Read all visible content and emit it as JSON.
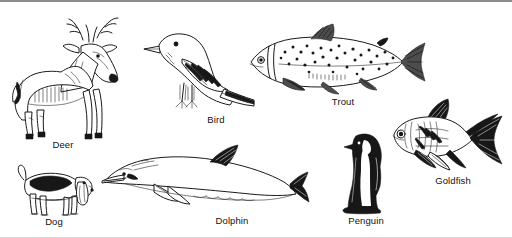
{
  "page": {
    "background_color": "#ffffff",
    "ink_color": "#1a1a1a",
    "border_color": "#8d8d8d",
    "width": 512,
    "height": 238,
    "style": "black-and-white line art drawings with captions"
  },
  "figures": [
    {
      "id": "deer",
      "label": "Deer",
      "icon": "deer-illustration",
      "group": "mammal",
      "facing": "right",
      "caption_x": 63,
      "caption_y": 142,
      "box": {
        "x": 5,
        "y": 10,
        "w": 125,
        "h": 130
      }
    },
    {
      "id": "bird",
      "label": "Bird",
      "icon": "bird-illustration",
      "group": "bird",
      "facing": "left",
      "caption_x": 215,
      "caption_y": 117,
      "box": {
        "x": 130,
        "y": 25,
        "w": 120,
        "h": 90
      }
    },
    {
      "id": "trout",
      "label": "Trout",
      "icon": "trout-illustration",
      "group": "fish",
      "facing": "left",
      "caption_x": 342,
      "caption_y": 99,
      "box": {
        "x": 245,
        "y": 20,
        "w": 180,
        "h": 75
      }
    },
    {
      "id": "goldfish",
      "label": "Goldfish",
      "icon": "goldfish-illustration",
      "group": "fish",
      "facing": "left",
      "caption_x": 452,
      "caption_y": 178,
      "box": {
        "x": 386,
        "y": 96,
        "w": 122,
        "h": 78
      }
    },
    {
      "id": "dog",
      "label": "Dog",
      "icon": "dog-illustration",
      "group": "mammal",
      "facing": "right",
      "caption_x": 54,
      "caption_y": 219,
      "box": {
        "x": 14,
        "y": 158,
        "w": 80,
        "h": 58
      }
    },
    {
      "id": "dolphin",
      "label": "Dolphin",
      "icon": "dolphin-illustration",
      "group": "mammal",
      "facing": "left",
      "caption_x": 232,
      "caption_y": 218,
      "box": {
        "x": 98,
        "y": 142,
        "w": 210,
        "h": 74
      }
    },
    {
      "id": "penguin",
      "label": "Penguin",
      "icon": "penguin-illustration",
      "group": "bird",
      "facing": "left",
      "caption_x": 366,
      "caption_y": 218,
      "box": {
        "x": 330,
        "y": 128,
        "w": 72,
        "h": 86
      }
    }
  ]
}
